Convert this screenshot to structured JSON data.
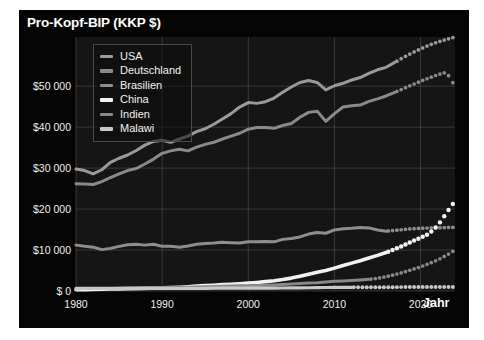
{
  "chart_data": {
    "type": "line",
    "title": "Pro-Kopf-BIP (KKP $)",
    "xlabel": "Jahr",
    "ylabel": "Pro-Kopf-BIP (KKP $)",
    "xlim": [
      1980,
      2024
    ],
    "ylim": [
      0,
      62000
    ],
    "grid": true,
    "legend_position": "top-left",
    "xticks": [
      1980,
      1990,
      2000,
      2010,
      2020
    ],
    "xticklabels": [
      "1980",
      "1990",
      "2000",
      "2010",
      "2020"
    ],
    "yticks": [
      0,
      10000,
      20000,
      30000,
      40000,
      50000
    ],
    "yticklabels": [
      "$ 0",
      "$10 000",
      "$20 000",
      "$30 000",
      "$40 000",
      "$50 000"
    ],
    "note": "Solid lines are historical data; dotted segments are projections beginning at each series' forecast_start year.",
    "series": [
      {
        "name": "USA",
        "color": "#9a9a9a",
        "forecast_start": 2017,
        "x": [
          1980,
          1981,
          1982,
          1983,
          1984,
          1985,
          1986,
          1987,
          1988,
          1989,
          1990,
          1991,
          1992,
          1993,
          1994,
          1995,
          1996,
          1997,
          1998,
          1999,
          2000,
          2001,
          2002,
          2003,
          2004,
          2005,
          2006,
          2007,
          2008,
          2009,
          2010,
          2011,
          2012,
          2013,
          2014,
          2015,
          2016,
          2017,
          2018,
          2019,
          2020,
          2021,
          2022,
          2023,
          2024
        ],
        "y": [
          29800,
          29400,
          28600,
          29600,
          31400,
          32400,
          33200,
          34300,
          35600,
          36500,
          36800,
          36300,
          37100,
          37800,
          38900,
          39600,
          40700,
          42000,
          43300,
          44900,
          46000,
          45800,
          46200,
          47100,
          48500,
          49800,
          50900,
          51400,
          50900,
          49100,
          50100,
          50700,
          51500,
          52100,
          53100,
          54000,
          54600,
          55800,
          57000,
          58100,
          59100,
          60000,
          60800,
          61400,
          62000
        ]
      },
      {
        "name": "Deutschland",
        "color": "#8a8a8a",
        "forecast_start": 2017,
        "x": [
          1980,
          1981,
          1982,
          1983,
          1984,
          1985,
          1986,
          1987,
          1988,
          1989,
          1990,
          1991,
          1992,
          1993,
          1994,
          1995,
          1996,
          1997,
          1998,
          1999,
          2000,
          2001,
          2002,
          2003,
          2004,
          2005,
          2006,
          2007,
          2008,
          2009,
          2010,
          2011,
          2012,
          2013,
          2014,
          2015,
          2016,
          2017,
          2018,
          2019,
          2020,
          2021,
          2022,
          2023,
          2024
        ],
        "y": [
          26200,
          26100,
          26000,
          26700,
          27700,
          28600,
          29400,
          29900,
          31000,
          32200,
          33600,
          34200,
          34600,
          34200,
          35100,
          35800,
          36300,
          37100,
          37800,
          38500,
          39500,
          39900,
          39900,
          39700,
          40400,
          40900,
          42400,
          43600,
          43900,
          41400,
          43300,
          44900,
          45200,
          45400,
          46300,
          46900,
          47600,
          48500,
          49400,
          50300,
          51200,
          52000,
          52800,
          53400,
          50000
        ]
      },
      {
        "name": "Brasilien",
        "color": "#8e8e8e",
        "forecast_start": 2016,
        "x": [
          1980,
          1981,
          1982,
          1983,
          1984,
          1985,
          1986,
          1987,
          1988,
          1989,
          1990,
          1991,
          1992,
          1993,
          1994,
          1995,
          1996,
          1997,
          1998,
          1999,
          2000,
          2001,
          2002,
          2003,
          2004,
          2005,
          2006,
          2007,
          2008,
          2009,
          2010,
          2011,
          2012,
          2013,
          2014,
          2015,
          2016,
          2017,
          2018,
          2019,
          2020,
          2021,
          2022,
          2023,
          2024
        ],
        "y": [
          11200,
          10900,
          10700,
          10100,
          10400,
          10900,
          11300,
          11400,
          11200,
          11400,
          10900,
          10900,
          10700,
          11000,
          11400,
          11600,
          11700,
          11900,
          11800,
          11700,
          12000,
          12000,
          12100,
          12000,
          12600,
          12800,
          13200,
          13900,
          14300,
          14100,
          14900,
          15200,
          15300,
          15500,
          15400,
          14900,
          14600,
          14800,
          15000,
          15200,
          15300,
          15400,
          15450,
          15500,
          15550
        ]
      },
      {
        "name": "China",
        "color": "#f2f2f2",
        "forecast_start": 2016,
        "x": [
          1980,
          1981,
          1982,
          1983,
          1984,
          1985,
          1986,
          1987,
          1988,
          1989,
          1990,
          1991,
          1992,
          1993,
          1994,
          1995,
          1996,
          1997,
          1998,
          1999,
          2000,
          2001,
          2002,
          2003,
          2004,
          2005,
          2006,
          2007,
          2008,
          2009,
          2010,
          2011,
          2012,
          2013,
          2014,
          2015,
          2016,
          2017,
          2018,
          2019,
          2020,
          2021,
          2022,
          2023,
          2024
        ],
        "y": [
          300,
          330,
          370,
          410,
          470,
          530,
          570,
          630,
          690,
          720,
          760,
          830,
          930,
          1050,
          1180,
          1300,
          1420,
          1550,
          1660,
          1780,
          1930,
          2090,
          2280,
          2510,
          2800,
          3150,
          3580,
          4100,
          4550,
          4980,
          5580,
          6200,
          6800,
          7400,
          8050,
          8700,
          9400,
          10200,
          11100,
          12100,
          13000,
          14000,
          16000,
          19000,
          22000
        ]
      },
      {
        "name": "Indien",
        "color": "#888888",
        "forecast_start": 2014,
        "x": [
          1980,
          1981,
          1982,
          1983,
          1984,
          1985,
          1986,
          1987,
          1988,
          1989,
          1990,
          1991,
          1992,
          1993,
          1994,
          1995,
          1996,
          1997,
          1998,
          1999,
          2000,
          2001,
          2002,
          2003,
          2004,
          2005,
          2006,
          2007,
          2008,
          2009,
          2010,
          2011,
          2012,
          2013,
          2014,
          2015,
          2016,
          2017,
          2018,
          2019,
          2020,
          2021,
          2022,
          2023,
          2024
        ],
        "y": [
          560,
          580,
          590,
          620,
          640,
          670,
          690,
          710,
          770,
          810,
          850,
          860,
          890,
          920,
          970,
          1030,
          1090,
          1130,
          1190,
          1270,
          1310,
          1360,
          1400,
          1490,
          1590,
          1710,
          1840,
          1980,
          2040,
          2180,
          2350,
          2470,
          2580,
          2700,
          2850,
          3100,
          3500,
          4000,
          4600,
          5200,
          5900,
          6700,
          7600,
          8700,
          10000
        ]
      },
      {
        "name": "Malawi",
        "color": "#c8c8c8",
        "forecast_start": 2012,
        "x": [
          1980,
          1981,
          1982,
          1983,
          1984,
          1985,
          1986,
          1987,
          1988,
          1989,
          1990,
          1991,
          1992,
          1993,
          1994,
          1995,
          1996,
          1997,
          1998,
          1999,
          2000,
          2001,
          2002,
          2003,
          2004,
          2005,
          2006,
          2007,
          2008,
          2009,
          2010,
          2011,
          2012,
          2013,
          2014,
          2015,
          2016,
          2017,
          2018,
          2019,
          2020,
          2021,
          2022,
          2023,
          2024
        ],
        "y": [
          620,
          630,
          620,
          620,
          630,
          640,
          620,
          590,
          600,
          610,
          630,
          670,
          610,
          650,
          610,
          650,
          680,
          690,
          700,
          720,
          720,
          700,
          700,
          710,
          730,
          740,
          760,
          790,
          820,
          850,
          880,
          900,
          900,
          910,
          920,
          930,
          930,
          940,
          950,
          960,
          960,
          970,
          980,
          990,
          1000
        ]
      }
    ]
  },
  "legend": {
    "items": [
      {
        "label": "USA",
        "color": "#9a9a9a"
      },
      {
        "label": "Deutschland",
        "color": "#8a8a8a"
      },
      {
        "label": "Brasilien",
        "color": "#8e8e8e"
      },
      {
        "label": "China",
        "color": "#f2f2f2"
      },
      {
        "label": "Indien",
        "color": "#888888"
      },
      {
        "label": "Malawi",
        "color": "#c8c8c8"
      }
    ]
  },
  "style": {
    "panel_background": "#050505",
    "plot_background": "#151515",
    "grid_color": "#6a6a6a",
    "text_color": "#efefef"
  }
}
